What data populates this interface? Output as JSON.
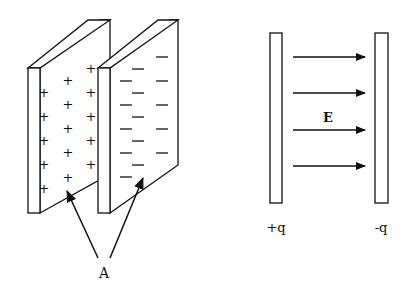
{
  "left_figure": {
    "label_A": "A",
    "plus_sign": "+",
    "minus_sign": "—"
  },
  "right_figure": {
    "field_label": "E",
    "left_plate_charge": "+q",
    "right_plate_charge": "-q",
    "arrow_count": 4
  },
  "colors": {
    "stroke": "#111111",
    "background": "#ffffff"
  }
}
